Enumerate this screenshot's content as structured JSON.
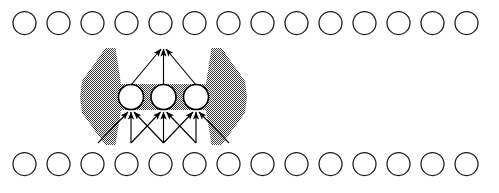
{
  "figure": {
    "name": "receptive-field-diagram",
    "type": "neural-network-layer-diagram",
    "width": 499,
    "height": 193,
    "background_color": "#ffffff"
  },
  "colors": {
    "circle_stroke": "#1a1a1a",
    "hidden_circle_stroke": "#000000",
    "circle_fill": "#ffffff",
    "arrow_color": "#000000",
    "field_shade": "#9a9a9a",
    "field_shade_pattern": "50% checkerboard dither"
  },
  "layers": {
    "output_row": {
      "label": "top-unit-row",
      "count": 14,
      "radius": 11.5,
      "center_y": 23,
      "first_center_x": 24.5,
      "pitch": 34.0
    },
    "input_row": {
      "label": "bottom-unit-row",
      "count": 14,
      "radius": 11.5,
      "center_y": 164,
      "first_center_x": 24.5,
      "pitch": 34.0
    },
    "hidden_row": {
      "label": "hidden-unit-row",
      "count": 3,
      "radius": 12.5,
      "center_y": 97,
      "centers_x": [
        131,
        163.5,
        196
      ]
    }
  },
  "receptive_field": {
    "label": "shaded-receptive-field",
    "apex_top_x": 163.5,
    "apex_top_y": 48,
    "band_top_y": 84,
    "band_bottom_y": 110,
    "left_outer_x": 80,
    "right_outer_x": 247,
    "bottom_y": 145
  },
  "connections": {
    "upward": {
      "label": "hidden-to-output-arrows",
      "count": 3,
      "from_x": [
        131,
        163.5,
        196
      ],
      "from_y": 84,
      "to_x": 163.5,
      "to_y": 48
    },
    "downward": {
      "label": "input-to-hidden-arrows",
      "count": 9,
      "source_x": [
        98,
        131,
        163.5,
        196,
        229
      ],
      "source_y": 143,
      "target_x": [
        131,
        163.5,
        196
      ],
      "target_y": 111,
      "pairs": [
        [
          98,
          131
        ],
        [
          131,
          131
        ],
        [
          163.5,
          131
        ],
        [
          131,
          163.5
        ],
        [
          163.5,
          163.5
        ],
        [
          196,
          163.5
        ],
        [
          163.5,
          196
        ],
        [
          196,
          196
        ],
        [
          229,
          196
        ]
      ]
    }
  }
}
